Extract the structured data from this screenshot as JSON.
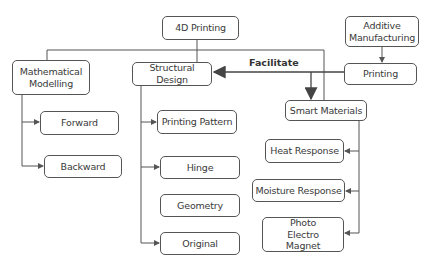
{
  "diagram": {
    "nodes": {
      "root": "4D Printing",
      "additive": "Additive Manufacturing",
      "printing": "Printing",
      "math": "Mathematical Modelling",
      "structural": "Structural Design",
      "smart": "Smart Materials",
      "forward": "Forward",
      "backward": "Backward",
      "pattern": "Printing Pattern",
      "hinge": "Hinge",
      "geometry": "Geometry",
      "original": "Original",
      "heat": "Heat Response",
      "moisture": "Moisture Response",
      "photo": "Photo Electro Magnet"
    },
    "edge_labels": {
      "facilitate": "Facilitate"
    },
    "colors": {
      "line": "#555555",
      "text": "#3a3a3a"
    }
  }
}
